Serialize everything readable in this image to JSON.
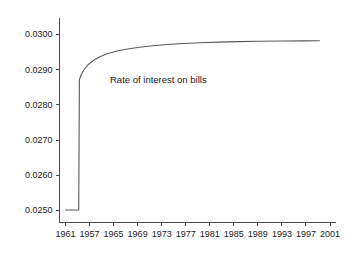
{
  "figure": {
    "width": 364,
    "height": 256,
    "background_color": "#ffffff",
    "line_color": "#5a5a5a",
    "axis_color": "#4a4a4a",
    "text_color": "#1a1a1a"
  },
  "annotation": {
    "label": "Rate of interest on bills"
  },
  "chart_data": {
    "type": "line",
    "title": "",
    "subtitle": "",
    "xlabel": "",
    "ylabel": "",
    "grid": false,
    "legend_position": "none",
    "annotations": [
      {
        "text": "Rate of interest on bills",
        "x": 1965.5,
        "y": 0.02875
      }
    ],
    "xlim": [
      1961,
      2001
    ],
    "ylim": [
      0.025,
      0.03
    ],
    "xticks": [
      1961,
      1957,
      1965,
      1969,
      1973,
      1977,
      1981,
      1985,
      1989,
      1993,
      1997,
      2001
    ],
    "xticklabels": [
      "1961",
      "1957",
      "1965",
      "1969",
      "1973",
      "1977",
      "1981",
      "1985",
      "1989",
      "1993",
      "1997",
      "2001"
    ],
    "yticks": [
      0.025,
      0.026,
      0.027,
      0.028,
      0.029,
      0.03
    ],
    "yticklabels": [
      "0.0250",
      "0.0260",
      "0.0270",
      "0.0280",
      "0.0290",
      "0.0300"
    ],
    "series": [
      {
        "name": "Rate of interest on bills",
        "color": "#5a5a5a",
        "x": [
          1961.0,
          1961.6,
          1962.2,
          1962.8,
          1963.0,
          1963.1,
          1963.4,
          1963.8,
          1964.4,
          1965.2,
          1966.2,
          1967.4,
          1968.8,
          1970.4,
          1972.2,
          1974.2,
          1976.4,
          1978.8,
          1981.4,
          1984.2,
          1987.2,
          1990.4,
          1993.8,
          1997.0,
          1999.4
        ],
        "y": [
          0.025,
          0.025,
          0.025,
          0.025,
          0.025,
          0.0287,
          0.028855,
          0.028985,
          0.029125,
          0.029245,
          0.029355,
          0.029445,
          0.029515,
          0.029575,
          0.029625,
          0.029665,
          0.0297,
          0.029728,
          0.02975,
          0.029768,
          0.029782,
          0.029793,
          0.0298,
          0.029805,
          0.029808
        ]
      }
    ]
  }
}
